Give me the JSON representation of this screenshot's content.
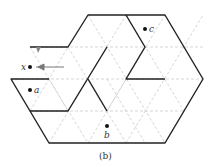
{
  "diagram": {
    "caption": "(b)",
    "points": [
      {
        "id": "x",
        "label": "x"
      },
      {
        "id": "a",
        "label": "a"
      },
      {
        "id": "b",
        "label": "b"
      },
      {
        "id": "c",
        "label": "c"
      }
    ],
    "colors": {
      "wall": "#222222",
      "grid": "#bbbbbb",
      "arrow": "#777777"
    }
  }
}
